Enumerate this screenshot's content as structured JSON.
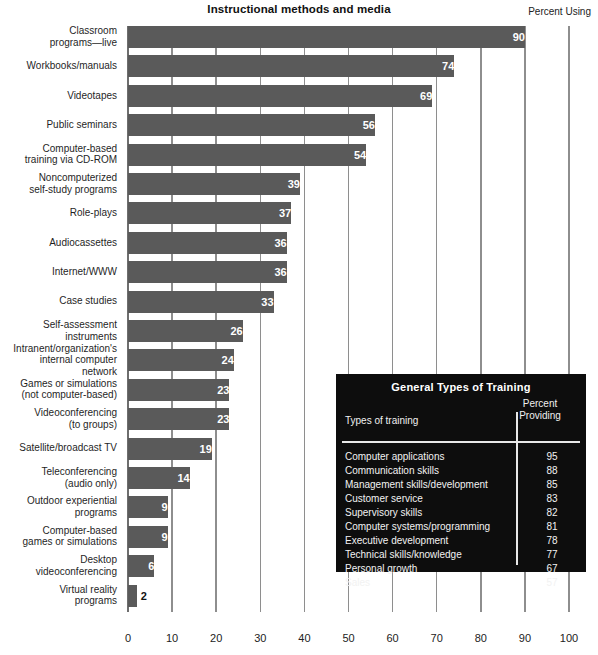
{
  "header": {
    "title": "Instructional methods and media",
    "percent_using_label": "Percent Using"
  },
  "chart_data": {
    "type": "bar",
    "orientation": "horizontal",
    "title": "Instructional methods and media",
    "xlabel": "Percent Using",
    "ylabel": "",
    "xlim": [
      0,
      100
    ],
    "xticks": [
      "0",
      "10",
      "20",
      "30",
      "40",
      "50",
      "60",
      "70",
      "80",
      "90",
      "100"
    ],
    "grid": true,
    "legend": "none",
    "bar_color": "#5a5a5a",
    "categories": [
      "Classroom programs—live",
      "Workbooks/manuals",
      "Videotapes",
      "Public seminars",
      "Computer-based training via CD-ROM",
      "Noncomputerized self-study programs",
      "Role-plays",
      "Audiocassettes",
      "Internet/WWW",
      "Case studies",
      "Self-assessment instruments",
      "Intranent/organization's internal computer network",
      "Games or simulations (not computer-based)",
      "Videoconferencing (to groups)",
      "Satellite/broadcast TV",
      "Teleconferencing (audio only)",
      "Outdoor experiential programs",
      "Computer-based games or simulations",
      "Desktop videoconferencing",
      "Virtual reality programs"
    ],
    "category_lines": [
      [
        "Classroom",
        "programs—live"
      ],
      [
        "Workbooks/manuals"
      ],
      [
        "Videotapes"
      ],
      [
        "Public seminars"
      ],
      [
        "Computer-based",
        "training via CD-ROM"
      ],
      [
        "Noncomputerized",
        "self-study programs"
      ],
      [
        "Role-plays"
      ],
      [
        "Audiocassettes"
      ],
      [
        "Internet/WWW"
      ],
      [
        "Case studies"
      ],
      [
        "Self-assessment",
        "instruments"
      ],
      [
        "Intranent/organization's",
        "internal computer",
        "network"
      ],
      [
        "Games or simulations",
        "(not computer-based)"
      ],
      [
        "Videoconferencing",
        "(to groups)"
      ],
      [
        "Satellite/broadcast TV"
      ],
      [
        "Teleconferencing",
        "(audio only)"
      ],
      [
        "Outdoor experiential",
        "programs"
      ],
      [
        "Computer-based",
        "games or simulations"
      ],
      [
        "Desktop",
        "videoconferencing"
      ],
      [
        "Virtual reality",
        "programs"
      ]
    ],
    "values": [
      90,
      74,
      69,
      56,
      54,
      39,
      37,
      36,
      36,
      33,
      26,
      24,
      23,
      23,
      19,
      14,
      9,
      9,
      6,
      2
    ]
  },
  "inset_table": {
    "title": "General Types of Training",
    "columns": [
      "Types of training",
      "Percent Providing"
    ],
    "column_right_lines": [
      "Percent",
      "Providing"
    ],
    "rows": [
      {
        "name": "Computer applications",
        "value": "95"
      },
      {
        "name": "Communication skills",
        "value": "88"
      },
      {
        "name": "Management skills/development",
        "value": "85"
      },
      {
        "name": "Customer service",
        "value": "83"
      },
      {
        "name": "Supervisory skills",
        "value": "82"
      },
      {
        "name": "Computer systems/programming",
        "value": "81"
      },
      {
        "name": "Executive development",
        "value": "78"
      },
      {
        "name": "Technical skills/knowledge",
        "value": "77"
      },
      {
        "name": "Personal growth",
        "value": "67"
      },
      {
        "name": "Sales",
        "value": "57"
      }
    ]
  }
}
